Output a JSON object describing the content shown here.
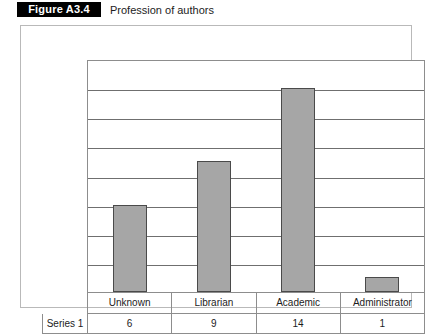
{
  "figure": {
    "number": "Figure A3.4",
    "title": "Profession of authors"
  },
  "table": {
    "series_label": "Series 1"
  },
  "colors": {
    "bar_fill": "#a6a6a6",
    "bar_border": "#4a4a4a",
    "gridline": "#6f6f6f",
    "frame": "#b9b9b9",
    "label_box_bg": "#000000",
    "label_box_text": "#ffffff"
  },
  "chart_data": {
    "type": "bar",
    "title": "Profession of authors",
    "categories": [
      "Unknown",
      "Librarian",
      "Academic",
      "Administrator"
    ],
    "values": [
      6,
      9,
      14,
      1
    ],
    "series": [
      {
        "name": "Series 1",
        "values": [
          6,
          9,
          14,
          1
        ]
      }
    ],
    "xlabel": "",
    "ylabel": "",
    "ylim": [
      0,
      16
    ],
    "yticks": [
      0,
      2,
      4,
      6,
      8,
      10,
      12,
      14,
      16
    ],
    "grid": true,
    "axis_labels_visible": false,
    "legend": "none",
    "data_table_visible": true
  }
}
